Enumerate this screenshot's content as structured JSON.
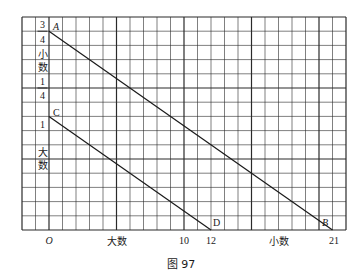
{
  "figure": {
    "caption": "图 97",
    "grid": {
      "columns": 24,
      "rows": 15,
      "line_color": "#2a2a2a"
    },
    "y_axis_labels": {
      "frac_top_num": "3",
      "frac_top_den": "4",
      "small_char1": "小",
      "small_char2": "数",
      "frac_bottom_num": "1",
      "frac_bottom_den": "4",
      "one": "1",
      "big_char1": "大",
      "big_char2": "数"
    },
    "x_axis_labels": {
      "origin": "O",
      "big_number": "大数",
      "ten": "10",
      "twelve": "12",
      "small_number": "小数",
      "twenty_one": "21"
    },
    "points": {
      "A": "A",
      "B": "B",
      "C": "C",
      "D": "D"
    },
    "lines": [
      {
        "name": "AB",
        "from": "A",
        "to": "B"
      },
      {
        "name": "CD",
        "from": "C",
        "to": "D"
      }
    ]
  }
}
